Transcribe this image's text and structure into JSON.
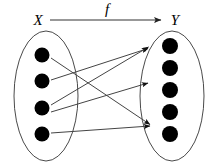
{
  "diagram": {
    "type": "function-mapping-diagram",
    "title_arrow_label": "f",
    "domain_set": {
      "label": "X",
      "element_count": 4,
      "ellipse": {
        "cx": 46,
        "cy": 96,
        "rx": 32,
        "ry": 65
      },
      "elements": [
        {
          "id": "x1",
          "cx": 42,
          "cy": 55,
          "r": 7.5
        },
        {
          "id": "x2",
          "cx": 42,
          "cy": 81,
          "r": 7.5
        },
        {
          "id": "x3",
          "cx": 42,
          "cy": 108,
          "r": 7.5
        },
        {
          "id": "x4",
          "cx": 42,
          "cy": 134,
          "r": 7.5
        }
      ]
    },
    "codomain_set": {
      "label": "Y",
      "element_count": 5,
      "ellipse": {
        "cx": 172,
        "cy": 96,
        "rx": 32,
        "ry": 65
      },
      "elements": [
        {
          "id": "y1",
          "cx": 170,
          "cy": 46,
          "r": 8
        },
        {
          "id": "y2",
          "cx": 170,
          "cy": 68,
          "r": 8
        },
        {
          "id": "y3",
          "cx": 170,
          "cy": 90,
          "r": 8
        },
        {
          "id": "y4",
          "cx": 170,
          "cy": 112,
          "r": 8
        },
        {
          "id": "y5",
          "cx": 170,
          "cy": 134,
          "r": 8
        }
      ]
    },
    "header_arrow": {
      "label": "f",
      "from_label": "X",
      "to_label": "Y",
      "x_label_pos": {
        "x": 38,
        "y": 24
      },
      "y_label_pos": {
        "x": 174,
        "y": 24
      },
      "f_label_pos": {
        "x": 107,
        "y": 13
      },
      "line": {
        "x1": 50,
        "y1": 20,
        "x2": 163,
        "y2": 20
      }
    },
    "mappings": [
      {
        "from": "x1",
        "to": "y5",
        "x1": 51,
        "y1": 58,
        "x2": 152,
        "y2": 125
      },
      {
        "from": "x2",
        "to": "y1",
        "x1": 51,
        "y1": 80,
        "x2": 150,
        "y2": 49
      },
      {
        "from": "x3",
        "to": "y3",
        "x1": 51,
        "y1": 105,
        "x2": 150,
        "y2": 84
      },
      {
        "from": "x4",
        "to": "y5",
        "x1": 51,
        "y1": 133,
        "x2": 152,
        "y2": 126
      },
      {
        "from": "x3b",
        "to": "y1",
        "x1": 51,
        "y1": 112,
        "x2": 150,
        "y2": 50
      }
    ],
    "colors": {
      "ink": "#000000",
      "outline": "#4a4a4a",
      "line": "#444444",
      "background": "#ffffff"
    }
  }
}
